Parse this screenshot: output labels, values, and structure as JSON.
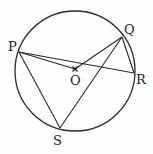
{
  "diagram": {
    "type": "circle-geometry",
    "circle": {
      "center": [
        75,
        71
      ],
      "radius": 60,
      "stroke": "#2a2a2a"
    },
    "points": {
      "P": {
        "label": "P",
        "x": 19,
        "y": 52,
        "label_x": 8,
        "label_y": 51
      },
      "Q": {
        "label": "Q",
        "x": 122,
        "y": 37,
        "label_x": 124,
        "label_y": 34
      },
      "R": {
        "label": "R",
        "x": 134,
        "y": 73,
        "label_x": 136,
        "label_y": 84
      },
      "S": {
        "label": "S",
        "x": 60,
        "y": 128,
        "label_x": 53,
        "label_y": 145
      },
      "O": {
        "label": "O",
        "x": 75,
        "y": 69,
        "label_x": 70,
        "label_y": 85
      }
    },
    "segments": [
      [
        "P",
        "R"
      ],
      [
        "P",
        "O"
      ],
      [
        "O",
        "Q"
      ],
      [
        "Q",
        "R"
      ],
      [
        "P",
        "S"
      ],
      [
        "S",
        "Q"
      ]
    ],
    "center_marker": "x"
  }
}
